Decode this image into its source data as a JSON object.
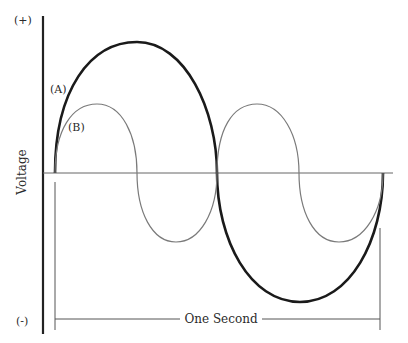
{
  "diagram": {
    "y_axis": {
      "label": "Voltage",
      "top_label": "(+)",
      "bottom_label": "(-)"
    },
    "x_span_label": "One Second",
    "waves": [
      {
        "label": "(A)",
        "cycles_per_second": 1,
        "style": "thick-dark",
        "color": "#1a1a1a"
      },
      {
        "label": "(B)",
        "cycles_per_second": 2,
        "style": "thin-gray",
        "color": "#7a7a7a"
      }
    ],
    "colors": {
      "axis": "#222222",
      "baseline": "#666666",
      "wave_a": "#1a1a1a",
      "wave_b": "#7a7a7a",
      "bracket": "#555555"
    }
  }
}
